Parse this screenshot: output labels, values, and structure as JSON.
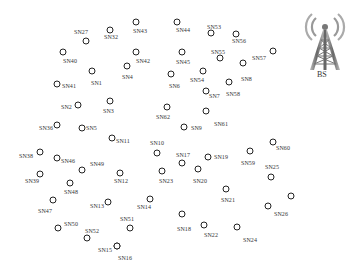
{
  "diagram": {
    "type": "wireless-sensor-network",
    "base_station": {
      "label": "BS",
      "icon": "radio-tower-icon"
    },
    "nodes": [
      {
        "id": "SN27",
        "cx": 86,
        "cy": 41,
        "lx": 74,
        "ly": 32
      },
      {
        "id": "SN32",
        "cx": 110,
        "cy": 30,
        "lx": 104,
        "ly": 37
      },
      {
        "id": "SN43",
        "cx": 136,
        "cy": 22,
        "lx": 133,
        "ly": 31
      },
      {
        "id": "SN44",
        "cx": 177,
        "cy": 22,
        "lx": 176,
        "ly": 30
      },
      {
        "id": "SN53",
        "cx": 211,
        "cy": 33,
        "lx": 207,
        "ly": 27
      },
      {
        "id": "SN56",
        "cx": 236,
        "cy": 34,
        "lx": 232,
        "ly": 41
      },
      {
        "id": "SN40",
        "cx": 63,
        "cy": 52,
        "lx": 63,
        "ly": 61
      },
      {
        "id": "SN42",
        "cx": 136,
        "cy": 52,
        "lx": 136,
        "ly": 61
      },
      {
        "id": "SN45",
        "cx": 182,
        "cy": 52,
        "lx": 176,
        "ly": 62
      },
      {
        "id": "SN55",
        "cx": 220,
        "cy": 58,
        "lx": 211,
        "ly": 52
      },
      {
        "id": "SN57",
        "cx": 273,
        "cy": 51,
        "lx": 252,
        "ly": 58
      },
      {
        "id": "SN4",
        "cx": 127,
        "cy": 66,
        "lx": 122,
        "ly": 77
      },
      {
        "id": "SN1",
        "cx": 92,
        "cy": 71,
        "lx": 91,
        "ly": 83
      },
      {
        "id": "SN8",
        "cx": 243,
        "cy": 63,
        "lx": 241,
        "ly": 79
      },
      {
        "id": "SN6",
        "cx": 171,
        "cy": 74,
        "lx": 169,
        "ly": 86
      },
      {
        "id": "SN54",
        "cx": 203,
        "cy": 71,
        "lx": 190,
        "ly": 80
      },
      {
        "id": "SN41",
        "cx": 57,
        "cy": 84,
        "lx": 62,
        "ly": 86
      },
      {
        "id": "SN7",
        "cx": 206,
        "cy": 91,
        "lx": 209,
        "ly": 96
      },
      {
        "id": "SN58",
        "cx": 229,
        "cy": 82,
        "lx": 226,
        "ly": 94
      },
      {
        "id": "SN2",
        "cx": 78,
        "cy": 105,
        "lx": 61,
        "ly": 107
      },
      {
        "id": "SN3",
        "cx": 110,
        "cy": 101,
        "lx": 103,
        "ly": 111
      },
      {
        "id": "SN62",
        "cx": 167,
        "cy": 107,
        "lx": 156,
        "ly": 117
      },
      {
        "id": "SN61",
        "cx": 206,
        "cy": 111,
        "lx": 214,
        "ly": 124
      },
      {
        "id": "SN9",
        "cx": 184,
        "cy": 127,
        "lx": 191,
        "ly": 128
      },
      {
        "id": "SN36",
        "cx": 57,
        "cy": 125,
        "lx": 39,
        "ly": 128
      },
      {
        "id": "SN5",
        "cx": 82,
        "cy": 128,
        "lx": 86,
        "ly": 128
      },
      {
        "id": "SN11",
        "cx": 112,
        "cy": 138,
        "lx": 116,
        "ly": 141
      },
      {
        "id": "SN10",
        "cx": 157,
        "cy": 153,
        "lx": 150,
        "ly": 143
      },
      {
        "id": "SN17",
        "cx": 182,
        "cy": 163,
        "lx": 176,
        "ly": 155
      },
      {
        "id": "SN19",
        "cx": 208,
        "cy": 157,
        "lx": 214,
        "ly": 157
      },
      {
        "id": "SN59",
        "cx": 250,
        "cy": 151,
        "lx": 241,
        "ly": 163
      },
      {
        "id": "SN60",
        "cx": 273,
        "cy": 142,
        "lx": 276,
        "ly": 148
      },
      {
        "id": "SN25",
        "cx": 271,
        "cy": 177,
        "lx": 265,
        "ly": 167
      },
      {
        "id": "SN38",
        "cx": 40,
        "cy": 152,
        "lx": 19,
        "ly": 156
      },
      {
        "id": "SN46",
        "cx": 57,
        "cy": 158,
        "lx": 61,
        "ly": 161
      },
      {
        "id": "SN49",
        "cx": 82,
        "cy": 170,
        "lx": 90,
        "ly": 164
      },
      {
        "id": "SN12",
        "cx": 120,
        "cy": 173,
        "lx": 114,
        "ly": 181
      },
      {
        "id": "SN23",
        "cx": 162,
        "cy": 171,
        "lx": 159,
        "ly": 181
      },
      {
        "id": "SN20",
        "cx": 198,
        "cy": 169,
        "lx": 193,
        "ly": 181
      },
      {
        "id": "SN39",
        "cx": 40,
        "cy": 174,
        "lx": 25,
        "ly": 181
      },
      {
        "id": "SN48",
        "cx": 70,
        "cy": 183,
        "lx": 64,
        "ly": 192
      },
      {
        "id": "SN21",
        "cx": 226,
        "cy": 189,
        "lx": 221,
        "ly": 200
      },
      {
        "id": "SN47",
        "cx": 53,
        "cy": 200,
        "lx": 38,
        "ly": 211
      },
      {
        "id": "SN13",
        "cx": 108,
        "cy": 202,
        "lx": 90,
        "ly": 206
      },
      {
        "id": "SN14",
        "cx": 150,
        "cy": 199,
        "lx": 137,
        "ly": 207
      },
      {
        "id": "SN26",
        "cx": 268,
        "cy": 206,
        "lx": 274,
        "ly": 214
      },
      {
        "id": "",
        "cx": 291,
        "cy": 196,
        "lx": 0,
        "ly": 0
      },
      {
        "id": "SN50",
        "cx": 58,
        "cy": 228,
        "lx": 64,
        "ly": 224
      },
      {
        "id": "SN51",
        "cx": 130,
        "cy": 228,
        "lx": 120,
        "ly": 219
      },
      {
        "id": "SN52",
        "cx": 87,
        "cy": 238,
        "lx": 85,
        "ly": 231
      },
      {
        "id": "SN18",
        "cx": 182,
        "cy": 214,
        "lx": 177,
        "ly": 229
      },
      {
        "id": "SN22",
        "cx": 204,
        "cy": 225,
        "lx": 204,
        "ly": 235
      },
      {
        "id": "SN24",
        "cx": 237,
        "cy": 227,
        "lx": 243,
        "ly": 240
      },
      {
        "id": "SN15",
        "cx": 117,
        "cy": 246,
        "lx": 98,
        "ly": 250
      },
      {
        "id": "SN16",
        "cx": 117,
        "cy": 246,
        "lx": 118,
        "ly": 258
      }
    ]
  },
  "colors": {
    "node_stroke": "#222222",
    "label_text": "#333333",
    "tower": "#888888",
    "background": "#ffffff"
  }
}
